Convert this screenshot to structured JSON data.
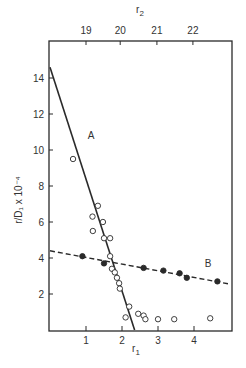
{
  "chart_data": {
    "type": "scatter",
    "title": "",
    "xlabel": "r₁",
    "x2label": "r₂",
    "ylabel": "r/D₁ x 10⁻⁴",
    "xlim": [
      0,
      5.0
    ],
    "ylim": [
      0,
      15.5
    ],
    "x_ticks": [
      1,
      2,
      3,
      4
    ],
    "x2_ticks": [
      {
        "label": "19",
        "pos": 1.0
      },
      {
        "label": "20",
        "pos": 1.95
      },
      {
        "label": "21",
        "pos": 2.97
      },
      {
        "label": "22",
        "pos": 3.97
      }
    ],
    "y_ticks": [
      2,
      4,
      6,
      8,
      10,
      12,
      14
    ],
    "grid": false,
    "legend": "none (inline labels A and B)",
    "series": [
      {
        "name": "A",
        "marker": "open-circle",
        "points": [
          [
            0.64,
            9.5
          ],
          [
            1.33,
            6.9
          ],
          [
            1.18,
            6.3
          ],
          [
            1.47,
            6.0
          ],
          [
            1.19,
            5.5
          ],
          [
            1.5,
            5.1
          ],
          [
            1.67,
            5.1
          ],
          [
            1.67,
            4.1
          ],
          [
            1.72,
            3.4
          ],
          [
            1.8,
            3.2
          ],
          [
            1.86,
            2.9
          ],
          [
            1.92,
            2.6
          ],
          [
            1.94,
            2.3
          ],
          [
            2.1,
            0.7
          ],
          [
            2.2,
            1.3
          ],
          [
            2.45,
            0.9
          ],
          [
            2.6,
            0.8
          ],
          [
            2.65,
            0.6
          ],
          [
            3.0,
            0.6
          ],
          [
            3.45,
            0.6
          ],
          [
            4.45,
            0.65
          ]
        ],
        "fit_line": {
          "style": "solid",
          "from": [
            0,
            14.6
          ],
          "to": [
            2.35,
            0
          ]
        }
      },
      {
        "name": "B",
        "marker": "filled-circle",
        "points": [
          [
            0.9,
            4.1
          ],
          [
            1.5,
            3.7
          ],
          [
            2.6,
            3.45
          ],
          [
            3.15,
            3.3
          ],
          [
            3.6,
            3.15
          ],
          [
            3.8,
            2.9
          ],
          [
            4.65,
            2.7
          ]
        ],
        "fit_line": {
          "style": "dashed",
          "from": [
            0,
            4.4
          ],
          "to": [
            5.0,
            2.55
          ]
        }
      }
    ],
    "annotations": [
      {
        "text": "A",
        "x": 1.05,
        "y": 10.6
      },
      {
        "text": "B",
        "x": 4.3,
        "y": 3.5
      }
    ]
  },
  "labels": {
    "x_axis": "r",
    "x_axis_sub": "1",
    "x2_axis": "r",
    "x2_axis_sub": "2",
    "y_axis": "r/D₁ x 10⁻⁴",
    "series_a": "A",
    "series_b": "B"
  },
  "colors": {
    "ink": "#2a2a2a",
    "background": "#ffffff"
  }
}
